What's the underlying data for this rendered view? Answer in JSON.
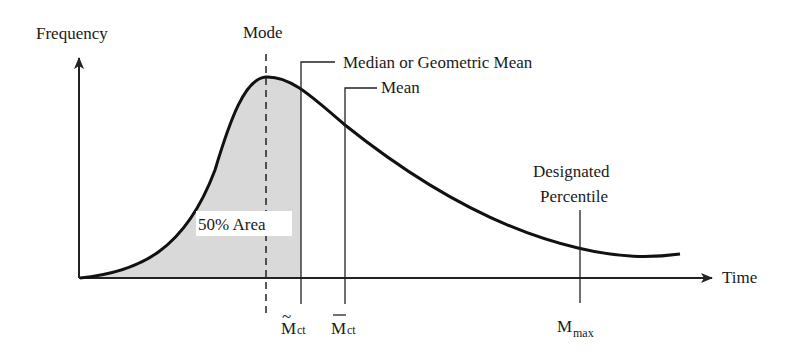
{
  "axes": {
    "y_label": "Frequency",
    "x_label": "Time"
  },
  "annotations": {
    "mode": "Mode",
    "median": "Median or Geometric Mean",
    "mean": "Mean",
    "percentile_line1": "Designated",
    "percentile_line2": "Percentile",
    "area": "50% Area"
  },
  "ticks": {
    "median_symbol": "M",
    "median_sub": "ct",
    "median_accent": "~",
    "mean_symbol": "M",
    "mean_sub": "ct",
    "max_symbol": "M",
    "max_sub": "max"
  },
  "colors": {
    "curve": "#111111",
    "shade": "#d9d9d9",
    "axis": "#222222"
  }
}
